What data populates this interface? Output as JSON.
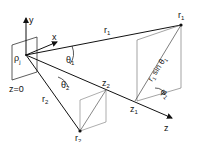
{
  "diagram": {
    "labels": {
      "y_axis": "y",
      "x_axis": "x",
      "z_axis": "z",
      "plane": "z=0",
      "rho": "ρ",
      "rho_sub": "j",
      "r1_line": "r",
      "r1_line_sub": "1",
      "r1_point": "r",
      "r1_point_sub": "1",
      "theta1": "θ",
      "theta1_sub": "1",
      "r2_line": "r",
      "r2_line_sub": "2",
      "theta2": "θ",
      "theta2_sub": "2",
      "z2": "z",
      "z2_sub": "2",
      "r2_point": "r",
      "r2_point_sub": "2",
      "z1": "z",
      "z1_sub": "1",
      "r1sin": "r",
      "r1sin_sub": "1",
      "r1sin_text": " sin θ",
      "r1sin_theta_sub": "1",
      "phi": "φ",
      "phi_sub": "1"
    },
    "colors": {
      "line": "#111111",
      "dashed": "#555555"
    }
  }
}
